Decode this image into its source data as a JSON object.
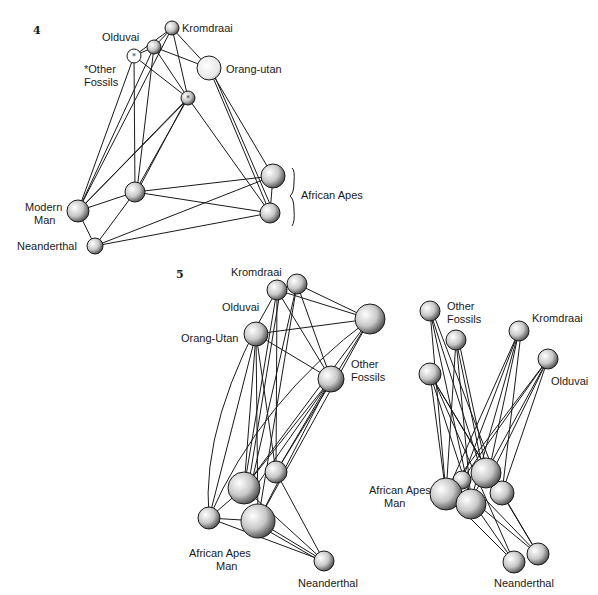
{
  "panels": [
    {
      "number": "4",
      "labels": {
        "kromdraai": "Kromdraai",
        "olduvai": "Olduvai",
        "other_fossils_1": "*Other",
        "other_fossils_2": "Fossils",
        "orang_utan": "Orang-utan",
        "african_apes": "African Apes",
        "modern_man_1": "Modern",
        "modern_man_2": "Man",
        "neanderthal": "Neanderthal"
      },
      "nodes": [
        {
          "id": "kromdraai",
          "x": 172,
          "y": 28,
          "r": 7
        },
        {
          "id": "olduvai",
          "x": 154,
          "y": 47,
          "r": 7
        },
        {
          "id": "other_star",
          "x": 134,
          "y": 56,
          "r": 7,
          "star": true
        },
        {
          "id": "orang",
          "x": 209,
          "y": 68,
          "r": 12
        },
        {
          "id": "center_star",
          "x": 188,
          "y": 98,
          "r": 7,
          "star": true
        },
        {
          "id": "mid",
          "x": 135,
          "y": 192,
          "r": 10
        },
        {
          "id": "modern",
          "x": 78,
          "y": 211,
          "r": 11
        },
        {
          "id": "neanderthal",
          "x": 95,
          "y": 246,
          "r": 8
        },
        {
          "id": "apes_top",
          "x": 273,
          "y": 176,
          "r": 12
        },
        {
          "id": "apes_bot",
          "x": 270,
          "y": 213,
          "r": 10
        }
      ]
    },
    {
      "number": "5",
      "labels": {
        "kromdraai": "Kromdraai",
        "olduvai": "Olduvai",
        "orang_utan": "Orang-Utan",
        "other_fossils_1": "Other",
        "other_fossils_2": "Fossils",
        "african_apes": "African Apes",
        "man": "Man",
        "neanderthal": "Neanderthal"
      }
    },
    {
      "labels": {
        "other_fossils_1": "Other",
        "other_fossils_2": "Fossils",
        "kromdraai": "Kromdraai",
        "olduvai": "Olduvai",
        "african_apes": "African Apes",
        "man": "Man",
        "neanderthal": "Neanderthal"
      }
    }
  ]
}
